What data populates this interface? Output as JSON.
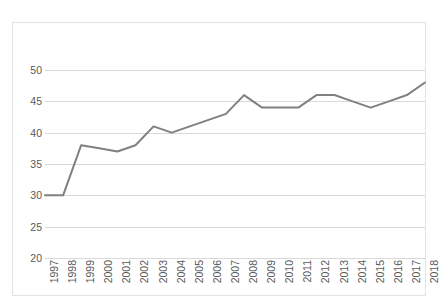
{
  "chart_data": {
    "type": "line",
    "title": "",
    "subtitle": "",
    "xlabel": "",
    "ylabel": "",
    "categories": [
      "1997",
      "1998",
      "1999",
      "2000",
      "2001",
      "2002",
      "2003",
      "2004",
      "2005",
      "2006",
      "2007",
      "2008",
      "2009",
      "2010",
      "2011",
      "2012",
      "2013",
      "2014",
      "2015",
      "2016",
      "2017",
      "2018"
    ],
    "values": [
      30,
      30,
      38,
      37.5,
      37,
      38,
      41,
      40,
      41,
      42,
      43,
      46,
      44,
      44,
      44,
      46,
      46,
      45,
      44,
      45,
      46,
      48
    ],
    "series": [
      {
        "name": "",
        "color": "#808080",
        "values": [
          30,
          30,
          38,
          37.5,
          37,
          38,
          41,
          40,
          41,
          42,
          43,
          46,
          44,
          44,
          44,
          46,
          46,
          45,
          44,
          45,
          46,
          48
        ]
      }
    ],
    "ylim": [
      20,
      50
    ],
    "y_ticks": [
      20,
      25,
      30,
      35,
      40,
      45,
      50
    ],
    "y_tick_labels": [
      "20",
      "25",
      "30",
      "35",
      "40",
      "45",
      "50"
    ],
    "x_tick_labels": [
      "1997",
      "1998",
      "1999",
      "2000",
      "2001",
      "2002",
      "2003",
      "2004",
      "2005",
      "2006",
      "2007",
      "2008",
      "2009",
      "2010",
      "2011",
      "2012",
      "2013",
      "2014",
      "2015",
      "2016",
      "2017",
      "2018"
    ],
    "grid": true,
    "grid_axis": "y",
    "legend": false,
    "legend_position": "none",
    "annotations": []
  },
  "style": {
    "background": "#ffffff",
    "frame_border": "#e2e2e2",
    "gridline_color": "#d9d9d9",
    "tick_label_color": "#595959",
    "line_color": "#808080",
    "line_width": 2
  }
}
